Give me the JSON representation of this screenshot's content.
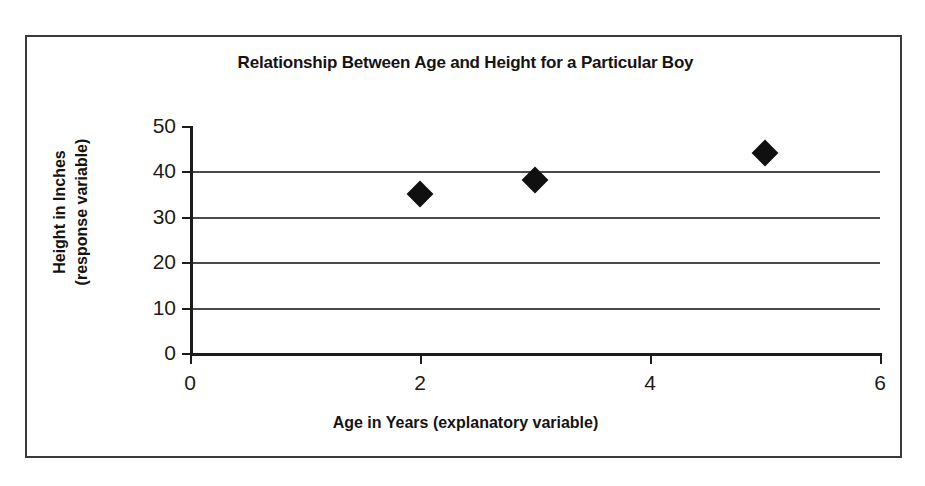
{
  "chart_data": {
    "type": "scatter",
    "title": "Relationship Between Age and Height for a Particular Boy",
    "xlabel": "Age in Years (explanatory variable)",
    "ylabel_line1": "Height in Inches",
    "ylabel_line2": "(response variable)",
    "ylabel": "Height in Inches (response variable)",
    "xlim": [
      0,
      6
    ],
    "ylim": [
      0,
      50
    ],
    "xticks": [
      "0",
      "2",
      "4",
      "6"
    ],
    "xtick_values": [
      0,
      2,
      4,
      6
    ],
    "yticks": [
      "0",
      "10",
      "20",
      "30",
      "40",
      "50"
    ],
    "ytick_values": [
      0,
      10,
      20,
      30,
      40,
      50
    ],
    "gridlines_y": [
      10,
      20,
      30,
      40
    ],
    "grid": "horizontal",
    "legend": "none",
    "marker": "diamond",
    "marker_color": "#101010",
    "x": [
      2,
      3,
      5
    ],
    "y": [
      35,
      38,
      44
    ],
    "points": [
      {
        "x": 2,
        "y": 35
      },
      {
        "x": 3,
        "y": 38
      },
      {
        "x": 5,
        "y": 44
      }
    ],
    "series": [
      {
        "name": "Height",
        "points": [
          {
            "x": 2,
            "y": 35
          },
          {
            "x": 3,
            "y": 38
          },
          {
            "x": 5,
            "y": 44
          }
        ]
      }
    ]
  },
  "style": {
    "background": "#ffffff",
    "frame_color": "#3a3a3a",
    "axis_color": "#1c1c1c",
    "grid_color": "#4a4a4a",
    "text_color": "#141414"
  }
}
